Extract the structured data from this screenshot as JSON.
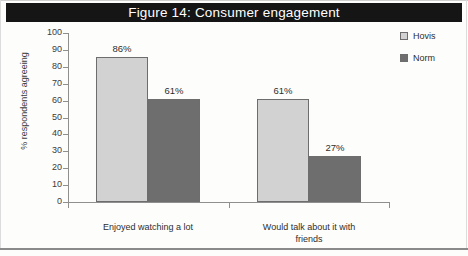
{
  "figure": {
    "title": "Figure 14: Consumer engagement",
    "title_bar_color": "#151515",
    "title_text_color": "#ffffff"
  },
  "chart_data": {
    "type": "bar",
    "title": "Figure 14: Consumer engagement",
    "xlabel": "",
    "ylabel": "% respondents agreeing",
    "ylim": [
      0,
      100
    ],
    "ytick_step": 10,
    "yticks": [
      "100",
      "90",
      "80",
      "70",
      "60",
      "50",
      "40",
      "30",
      "20",
      "10",
      "0"
    ],
    "grid": false,
    "legend_position": "top-right",
    "categories": [
      "Enjoyed watching a lot",
      "Would talk about it with friends"
    ],
    "category_lines": [
      [
        "Enjoyed watching a lot"
      ],
      [
        "Would talk about it with",
        "friends"
      ]
    ],
    "series": [
      {
        "name": "Hovis",
        "color": "#d2d2d2",
        "values": [
          86,
          61
        ],
        "labels": [
          "86%",
          "61%"
        ]
      },
      {
        "name": "Norm",
        "color": "#6e6e6e",
        "values": [
          61,
          27
        ],
        "labels": [
          "61%",
          "27%"
        ]
      }
    ]
  },
  "legend": {
    "items": [
      {
        "label": "Hovis",
        "swatch": "hovis"
      },
      {
        "label": "Norm",
        "swatch": "norm"
      }
    ]
  }
}
